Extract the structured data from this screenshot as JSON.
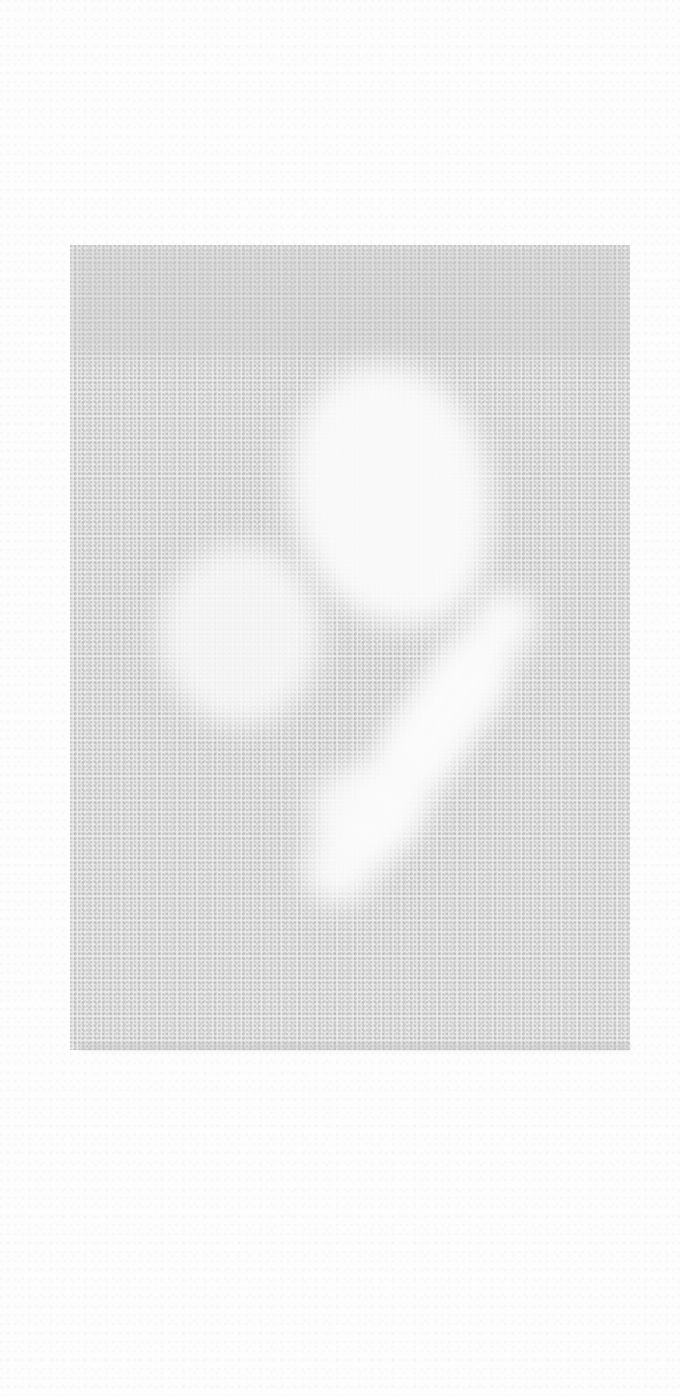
{
  "image": {
    "description": "Faded, noisy grayscale scan with a speckled gray rectangular region containing lighter blotchy/diagonal shapes; no legible text or UI controls",
    "colors": {
      "page_background": "#fdfdfd",
      "noise_block": "#ebebeb",
      "light_shape": "#fbfbfb"
    }
  }
}
